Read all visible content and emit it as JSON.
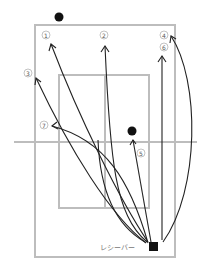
{
  "diagram": {
    "title": "",
    "receiver_label": "レシーバー",
    "colors": {
      "court_line": "#bdbdbd",
      "trajectory": "#222222",
      "player": "#111111",
      "label": "#777777"
    },
    "markers": [
      {
        "id": "top-player",
        "shape": "circle",
        "x": 59,
        "y": 17
      },
      {
        "id": "mid-player",
        "shape": "circle",
        "x": 132,
        "y": 130
      },
      {
        "id": "receiver",
        "shape": "square",
        "x": 154,
        "y": 247
      }
    ],
    "trajectories": [
      {
        "number": "①",
        "label": "1",
        "label_x": 46,
        "label_y": 35
      },
      {
        "number": "②",
        "label": "2",
        "label_x": 104,
        "label_y": 35
      },
      {
        "number": "③",
        "label": "3",
        "label_x": 28,
        "label_y": 73
      },
      {
        "number": "④",
        "label": "4",
        "label_x": 164,
        "label_y": 35
      },
      {
        "number": "⑤",
        "label": "5",
        "label_x": 141,
        "label_y": 153
      },
      {
        "number": "⑥",
        "label": "6",
        "label_x": 164,
        "label_y": 47
      },
      {
        "number": "⑦",
        "label": "7",
        "label_x": 44,
        "label_y": 125
      }
    ]
  }
}
